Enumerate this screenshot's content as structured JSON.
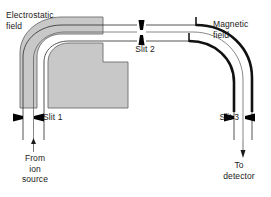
{
  "figure": {
    "type": "schematic-diagram",
    "background_color": "#ffffff",
    "line_color": "#1a1a1a",
    "field_fill_color": "#c8c8c8",
    "field_stroke_color": "#6e6e6e",
    "slit_marker_color": "#000000"
  },
  "labels": {
    "electrostatic_field": "Electrostatic\nfield",
    "magnetic_field": "Magnetic\nfield",
    "slit_1": "Slit 1",
    "slit_2": "Slit 2",
    "slit_3": "Slit 3",
    "from_ion_source": "From\nion\nsource",
    "to_detector": "To\ndetector"
  },
  "components": [
    {
      "name": "electrostatic-analyzer",
      "label": "Electrostatic field",
      "shape": "curved sector pair",
      "fill": "#c8c8c8"
    },
    {
      "name": "magnetic-analyzer",
      "label": "Magnetic field",
      "shape": "thick black arcs",
      "fill": "none"
    },
    {
      "name": "slit-1",
      "label": "Slit 1",
      "orientation": "horizontal-opposed-wedges"
    },
    {
      "name": "slit-2",
      "label": "Slit 2",
      "orientation": "vertical-opposed-wedges"
    },
    {
      "name": "slit-3",
      "label": "Slit 3",
      "orientation": "horizontal-opposed-wedges"
    },
    {
      "name": "ion-beam-entry",
      "label": "From ion source",
      "arrow": "up"
    },
    {
      "name": "ion-beam-exit",
      "label": "To detector",
      "arrow": "down"
    }
  ]
}
